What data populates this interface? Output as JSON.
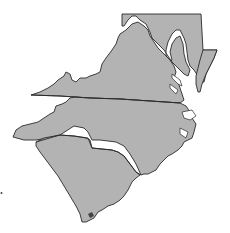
{
  "map": {
    "title": "Mid-Atlantic and Southeastern States",
    "fill_color": "#b3b3b3",
    "stroke_color": "#2a2a2a",
    "background": "#ffffff",
    "regions": [
      {
        "id": "maryland",
        "name": "Maryland"
      },
      {
        "id": "virginia",
        "name": "Virginia"
      },
      {
        "id": "north-carolina",
        "name": "North Carolina"
      },
      {
        "id": "south-carolina",
        "name": "South Carolina"
      }
    ]
  }
}
